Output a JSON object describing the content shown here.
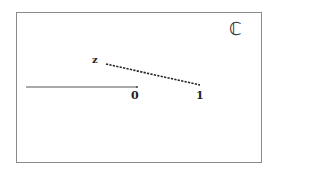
{
  "diagram": {
    "set_symbol": "ℂ",
    "point_labels": {
      "z": "z",
      "zero": "0",
      "one": "1"
    },
    "segments": [
      {
        "name": "real-axis-ray",
        "style": "solid",
        "from": [
          26,
          87
        ],
        "to": [
          137,
          87
        ]
      },
      {
        "name": "z-to-one-segment",
        "style": "dashed",
        "from": [
          106,
          64
        ],
        "to": [
          200,
          85
        ]
      }
    ],
    "colors": {
      "frame": "#8a8a8a",
      "solid_line": "#555555",
      "dashed_line": "#222222",
      "text": "#222222"
    }
  }
}
